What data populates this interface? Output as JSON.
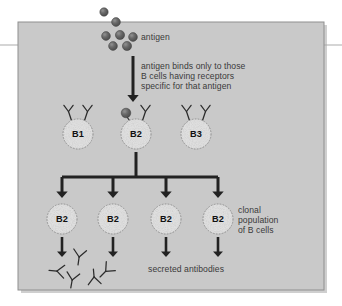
{
  "figure": {
    "kind": "biology-diagram",
    "topic": "clonal selection of B lymphocytes",
    "panel": {
      "x": 18,
      "y": 22,
      "width": 306,
      "height": 268,
      "fill": "#c9c9c9",
      "border": "#8f8f8f",
      "shadow": "#9e9e9e"
    },
    "page_rule": {
      "y": 45,
      "color": "#b0b0b0",
      "left_span": 20,
      "right_span": 20
    }
  },
  "colors": {
    "background": "#ffffff",
    "panel_fill": "#c9c9c9",
    "panel_border": "#8f8f8f",
    "ink": "#2b2b2b",
    "text": "#3a3a3a",
    "antigen_dot": "#5e5e5e",
    "antigen_dot_highlight": "#8c8c8c",
    "cell_fill": "#dcdcdc",
    "cell_edge": "#9a9a9a",
    "arrow": "#222222"
  },
  "labels": {
    "antigen": "antigen",
    "binding_note_line1": "antigen binds only to those",
    "binding_note_line2": "B cells having receptors",
    "binding_note_line3": "specific for that antigen",
    "clonal_line1": "clonal",
    "clonal_line2": "population",
    "clonal_line3": "of B cells",
    "secreted_antibodies": "secreted antibodies"
  },
  "antigen_dots": [
    {
      "cx": 104,
      "cy": 12,
      "r": 4.2
    },
    {
      "cx": 116,
      "cy": 22,
      "r": 4.4
    },
    {
      "cx": 106,
      "cy": 36,
      "r": 4.4
    },
    {
      "cx": 120,
      "cy": 35,
      "r": 4.6
    },
    {
      "cx": 133,
      "cy": 37,
      "r": 4.4
    },
    {
      "cx": 113,
      "cy": 46,
      "r": 4.4
    },
    {
      "cx": 127,
      "cy": 46,
      "r": 4.6
    }
  ],
  "main_arrow": {
    "x": 133,
    "y1": 56,
    "y2": 102,
    "width": 3.0,
    "head": 7
  },
  "selection_row": {
    "cy": 134,
    "cell_r": 15,
    "cells": [
      {
        "id": "b1",
        "name": "B1",
        "cx": 78,
        "bound": false,
        "receptors": [
          "left",
          "right"
        ]
      },
      {
        "id": "b2",
        "name": "B2",
        "cx": 136,
        "bound": true,
        "receptors": [
          "left",
          "right"
        ]
      },
      {
        "id": "b3",
        "name": "B3",
        "cx": 196,
        "bound": false,
        "receptors": [
          "left",
          "right"
        ]
      }
    ],
    "bound_antigen": {
      "cx": 126,
      "cy": 113,
      "r": 4.8
    }
  },
  "branch": {
    "stem_x": 136,
    "stem_y1": 152,
    "stem_y2": 175,
    "bar_y": 177,
    "bar_x1": 62,
    "bar_x2": 218,
    "arrow_y2": 198,
    "line_width": 3.0,
    "head": 6.5,
    "arrow_xs": [
      62,
      113,
      166,
      218
    ]
  },
  "clone_row": {
    "cy": 219,
    "cell_r": 15,
    "cells": [
      {
        "name": "B2",
        "cx": 62
      },
      {
        "name": "B2",
        "cx": 113
      },
      {
        "name": "B2",
        "cx": 166
      },
      {
        "name": "B2",
        "cx": 218
      }
    ],
    "secretion_arrows": {
      "y1": 237,
      "y2": 257,
      "width": 2.6,
      "head": 5.5
    }
  },
  "antibodies": [
    {
      "cx": 56,
      "cy": 271,
      "rot": 95,
      "s": 1.0
    },
    {
      "cx": 79,
      "cy": 258,
      "rot": 8,
      "s": 1.0
    },
    {
      "cx": 72,
      "cy": 281,
      "rot": 10,
      "s": 1.0
    },
    {
      "cx": 94,
      "cy": 276,
      "rot": 175,
      "s": 1.0
    },
    {
      "cx": 105,
      "cy": 272,
      "rot": 45,
      "s": 1.0
    }
  ],
  "text_positions": {
    "antigen": {
      "x": 141,
      "y": 32
    },
    "binding_note": {
      "x": 141,
      "y": 61
    },
    "clonal": {
      "x": 238,
      "y": 205
    },
    "secreted": {
      "x": 148,
      "y": 264
    }
  }
}
